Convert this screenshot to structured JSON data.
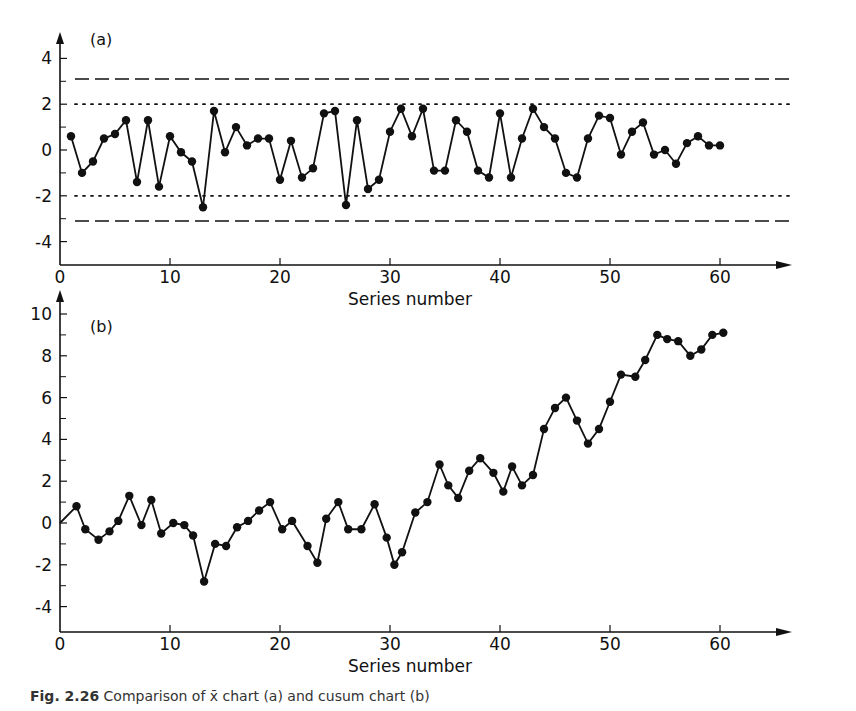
{
  "caption": {
    "figure_number": "Fig. 2.26",
    "text": "Comparison of x̄ chart (a) and cusum chart (b)"
  },
  "chart_data": [
    {
      "type": "line",
      "panel_label": "(a)",
      "title": "",
      "xlabel": "Series number",
      "ylabel": "",
      "xlim": [
        0,
        62
      ],
      "ylim": [
        -5,
        5
      ],
      "x_ticks": [
        0,
        10,
        20,
        30,
        40,
        50,
        60
      ],
      "y_ticks": [
        4,
        2,
        0,
        -2,
        -4
      ],
      "y_minor_ticks": [
        3,
        1,
        -1,
        -3
      ],
      "grid": false,
      "markers": "filled-circle",
      "reference_lines": [
        {
          "y": 3.1,
          "style": "dashed",
          "meaning": "action limit"
        },
        {
          "y": 2.0,
          "style": "dotted",
          "meaning": "warning limit"
        },
        {
          "y": -2.0,
          "style": "dotted",
          "meaning": "warning limit"
        },
        {
          "y": -3.1,
          "style": "dashed",
          "meaning": "action limit"
        }
      ],
      "x": [
        1,
        2,
        3,
        4,
        5,
        6,
        7,
        8,
        9,
        10,
        11,
        12,
        13,
        14,
        15,
        16,
        17,
        18,
        19,
        20,
        21,
        22,
        23,
        24,
        25,
        26,
        27,
        28,
        29,
        30,
        31,
        32,
        33,
        34,
        35,
        36,
        37,
        38,
        39,
        40,
        41,
        42,
        43,
        44,
        45,
        46,
        47,
        48,
        49,
        50,
        51,
        52,
        53,
        54,
        55,
        56,
        57,
        58,
        59,
        60
      ],
      "values": [
        0.6,
        -1.0,
        -0.5,
        0.5,
        0.7,
        1.3,
        -1.4,
        1.3,
        -1.6,
        0.6,
        -0.1,
        -0.5,
        -2.5,
        1.7,
        -0.1,
        1.0,
        0.2,
        0.5,
        0.5,
        -1.3,
        0.4,
        -1.2,
        -0.8,
        1.6,
        1.7,
        -2.4,
        1.3,
        -1.7,
        -1.3,
        0.8,
        1.8,
        0.6,
        1.8,
        -0.9,
        -0.9,
        1.3,
        0.8,
        -0.9,
        -1.2,
        1.6,
        -1.2,
        0.5,
        1.8,
        1.0,
        0.5,
        -1.0,
        -1.2,
        0.5,
        1.5,
        1.4,
        -0.2,
        0.8,
        1.2,
        -0.2,
        0.0,
        -0.6,
        0.3,
        0.6,
        0.2,
        0.2
      ]
    },
    {
      "type": "line",
      "panel_label": "(b)",
      "title": "",
      "xlabel": "Series number",
      "ylabel": "",
      "xlim": [
        0,
        62
      ],
      "ylim": [
        -5,
        11
      ],
      "x_ticks": [
        0,
        10,
        20,
        30,
        40,
        50,
        60
      ],
      "y_ticks": [
        10,
        8,
        6,
        4,
        2,
        0,
        -2,
        -4
      ],
      "y_minor_ticks": [
        9,
        7,
        5,
        3,
        1,
        -1,
        -3
      ],
      "grid": false,
      "markers": "filled-circle",
      "x": [
        0,
        1.5,
        2.3,
        3.5,
        4.5,
        5.3,
        6.3,
        7.4,
        8.3,
        9.2,
        10.3,
        11.3,
        12.1,
        13.1,
        14.1,
        15.1,
        16.1,
        17.1,
        18.1,
        19.1,
        20.2,
        21.1,
        22.5,
        23.4,
        24.2,
        25.3,
        26.2,
        27.4,
        28.6,
        29.7,
        30.4,
        31.1,
        32.3,
        33.4,
        34.5,
        35.3,
        36.2,
        37.2,
        38.2,
        39.4,
        40.3,
        41.1,
        42.0,
        43.0,
        44.0,
        45.0,
        46.0,
        47.0,
        48.0,
        49.0,
        50.0,
        51.0,
        52.3,
        53.2,
        54.3,
        55.2,
        56.2,
        57.3,
        58.3,
        59.3,
        60.3
      ],
      "values": [
        0.0,
        0.8,
        -0.3,
        -0.8,
        -0.4,
        0.1,
        1.3,
        -0.1,
        1.1,
        -0.5,
        0.0,
        -0.1,
        -0.6,
        -2.8,
        -1.0,
        -1.1,
        -0.2,
        0.1,
        0.6,
        1.0,
        -0.3,
        0.1,
        -1.1,
        -1.9,
        0.2,
        1.0,
        -0.3,
        -0.3,
        0.9,
        -0.7,
        -2.0,
        -1.4,
        0.5,
        1.0,
        2.8,
        1.8,
        1.2,
        2.5,
        3.1,
        2.4,
        1.5,
        2.7,
        1.8,
        2.3,
        4.5,
        5.5,
        6.0,
        4.9,
        3.8,
        4.5,
        5.8,
        7.1,
        7.0,
        7.8,
        9.0,
        8.8,
        8.7,
        8.0,
        8.3,
        9.0,
        9.1
      ]
    }
  ]
}
